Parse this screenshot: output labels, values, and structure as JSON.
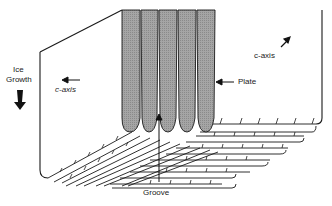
{
  "diagram": {
    "labels": {
      "ice_growth_line1": "Ice",
      "ice_growth_line2": "Growth",
      "c_axis_left": "c-axis",
      "c_axis_right": "c-axis",
      "plate": "Plate",
      "groove": "Groove"
    },
    "colors": {
      "plate_fill": "#9a9a9a",
      "line": "#1a1a1a",
      "background": "#ffffff"
    }
  }
}
